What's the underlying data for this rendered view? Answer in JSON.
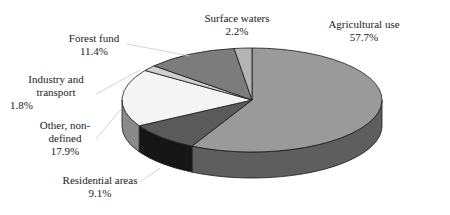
{
  "chart_data": {
    "type": "pie",
    "style": "3d",
    "title": "",
    "slices": [
      {
        "label": "Agricultural use",
        "value": 57.7,
        "display": "57.7%",
        "top_color": "#9a9a9a",
        "side_color": "#5e5e5e"
      },
      {
        "label": "Residential areas",
        "value": 9.1,
        "display": "9.1%",
        "top_color": "#5a5a5a",
        "side_color": "#161616"
      },
      {
        "label": "Other, non-defined",
        "value": 17.9,
        "display": "17.9%",
        "top_color": "#f4f4f4",
        "side_color": "#8a8a8a"
      },
      {
        "label": "Industry and transport",
        "value": 1.8,
        "display": "1.8%",
        "top_color": "#cfcfcf",
        "side_color": "#8a8a8a"
      },
      {
        "label": "Forest fund",
        "value": 11.4,
        "display": "11.4%",
        "top_color": "#7c7c7c",
        "side_color": "#4a4a4a"
      },
      {
        "label": "Surface waters",
        "value": 2.2,
        "display": "2.2%",
        "top_color": "#b4b4b4",
        "side_color": "#6a6a6a"
      }
    ],
    "legend": "none (callout labels)"
  },
  "labels": {
    "agri": {
      "line1": "Agricultural use",
      "line2": "57.7%"
    },
    "surface": {
      "line1": "Surface waters",
      "line2": "2.2%"
    },
    "forest": {
      "line1": "Forest fund",
      "line2": "11.4%"
    },
    "industry": {
      "line1": "Industry and",
      "line2": "transport",
      "line3": "1.8%"
    },
    "other": {
      "line1": "Other, non-",
      "line2": "defined",
      "line3": "17.9%"
    },
    "residential": {
      "line1": "Residential areas",
      "line2": "9.1%"
    }
  }
}
